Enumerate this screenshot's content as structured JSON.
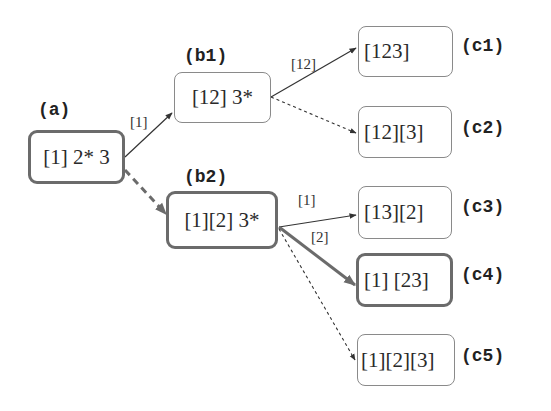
{
  "diagram": {
    "type": "tree",
    "colors": {
      "edge": "#333333",
      "edge_bold": "#6b6b6b",
      "border": "#8a8a8a",
      "border_bold": "#6b6b6b",
      "text": "#2a2a2a"
    },
    "nodes": {
      "a": {
        "tag": "(a)",
        "text": "[1] 2* 3",
        "highlighted": true
      },
      "b1": {
        "tag": "(b1)",
        "text": "[12] 3*",
        "highlighted": false
      },
      "b2": {
        "tag": "(b2)",
        "text": "[1][2] 3*",
        "highlighted": true
      },
      "c1": {
        "tag": "(c1)",
        "text": "[123]",
        "highlighted": false
      },
      "c2": {
        "tag": "(c2)",
        "text": "[12][3]",
        "highlighted": false
      },
      "c3": {
        "tag": "(c3)",
        "text": "[13][2]",
        "highlighted": false
      },
      "c4": {
        "tag": "(c4)",
        "text": "[1] [23]",
        "highlighted": true
      },
      "c5": {
        "tag": "(c5)",
        "text": "[1][2][3]",
        "highlighted": false
      }
    },
    "edges": {
      "a_b1": {
        "from": "a",
        "to": "b1",
        "label": "[1]",
        "style": "solid"
      },
      "a_b2": {
        "from": "a",
        "to": "b2",
        "label": "",
        "style": "dashed-bold"
      },
      "b1_c1": {
        "from": "b1",
        "to": "c1",
        "label": "[12]",
        "style": "solid"
      },
      "b1_c2": {
        "from": "b1",
        "to": "c2",
        "label": "",
        "style": "dotted"
      },
      "b2_c3": {
        "from": "b2",
        "to": "c3",
        "label": "[1]",
        "style": "solid"
      },
      "b2_c4": {
        "from": "b2",
        "to": "c4",
        "label": "[2]",
        "style": "solid-bold"
      },
      "b2_c5": {
        "from": "b2",
        "to": "c5",
        "label": "",
        "style": "dotted"
      }
    }
  }
}
